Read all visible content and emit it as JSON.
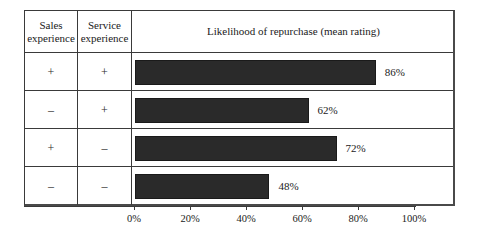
{
  "table": {
    "columns": [
      {
        "id": "sales",
        "header": "Sales\nexperience"
      },
      {
        "id": "service",
        "header": "Service\nexperience"
      },
      {
        "id": "chart",
        "header": "Likelihood of repurchase (mean rating)"
      }
    ],
    "header_sales_line1": "Sales",
    "header_sales_line2": "experience",
    "header_service_line1": "Service",
    "header_service_line2": "experience",
    "header_chart": "Likelihood of repurchase (mean rating)",
    "rows": [
      {
        "sales": "+",
        "service": "+",
        "value": 86,
        "label": "86%"
      },
      {
        "sales": "–",
        "service": "+",
        "value": 62,
        "label": "62%"
      },
      {
        "sales": "+",
        "service": "–",
        "value": 72,
        "label": "72%"
      },
      {
        "sales": "–",
        "service": "–",
        "value": 48,
        "label": "48%"
      }
    ]
  },
  "axis": {
    "ticks": [
      {
        "value": 0,
        "label": "0%"
      },
      {
        "value": 20,
        "label": "20%"
      },
      {
        "value": 40,
        "label": "40%"
      },
      {
        "value": 60,
        "label": "60%"
      },
      {
        "value": 80,
        "label": "80%"
      },
      {
        "value": 100,
        "label": "100%"
      }
    ],
    "min": 0,
    "max": 100
  },
  "colors": {
    "bar": "#2a2a2a",
    "border": "#3a3a3a",
    "text": "#1a1a1a",
    "background": "#ffffff"
  },
  "chart_data": {
    "type": "bar",
    "orientation": "horizontal",
    "title": "Likelihood of repurchase (mean rating)",
    "xlabel": "",
    "ylabel": "",
    "xlim": [
      0,
      100
    ],
    "grid": false,
    "legend": null,
    "categories": [
      "Sales experience +, Service experience +",
      "Sales experience –, Service experience +",
      "Sales experience +, Service experience –",
      "Sales experience –, Service experience –"
    ],
    "values": [
      86,
      62,
      72,
      48
    ],
    "data_labels": [
      "86%",
      "62%",
      "72%",
      "48%"
    ],
    "tick_labels": [
      "0%",
      "20%",
      "40%",
      "60%",
      "80%",
      "100%"
    ],
    "units": "percent"
  }
}
